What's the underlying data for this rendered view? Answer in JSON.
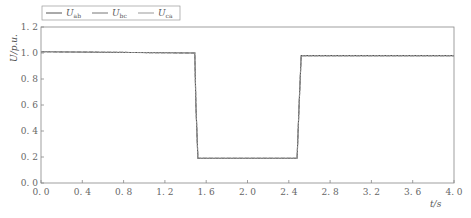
{
  "chart_data": {
    "type": "line",
    "title": "",
    "xlabel": "t/s",
    "ylabel": "U/p.u.",
    "xlim": [
      0.0,
      4.0
    ],
    "ylim": [
      0.0,
      1.2
    ],
    "xticks": [
      "0.0",
      "0.4",
      "0.8",
      "1.2",
      "1.6",
      "2.0",
      "2.4",
      "2.8",
      "3.2",
      "3.6",
      "4.0"
    ],
    "yticks": [
      "0.0",
      "0.2",
      "0.4",
      "0.6",
      "0.8",
      "1.0",
      "1.2"
    ],
    "grid": false,
    "legend_position": "top-left, above plot",
    "legend": [
      "U_ab",
      "U_bc",
      "U_ca"
    ],
    "series": [
      {
        "name": "U_ab",
        "color": "#555555",
        "points": [
          [
            0.0,
            1.01
          ],
          [
            1.49,
            1.0
          ],
          [
            1.5,
            0.6
          ],
          [
            1.52,
            0.19
          ],
          [
            2.48,
            0.19
          ],
          [
            2.5,
            0.6
          ],
          [
            2.52,
            0.98
          ],
          [
            4.0,
            0.98
          ]
        ]
      },
      {
        "name": "U_bc",
        "color": "#777777",
        "points": [
          [
            0.0,
            1.01
          ],
          [
            1.49,
            1.0
          ],
          [
            1.5,
            0.6
          ],
          [
            1.52,
            0.19
          ],
          [
            2.48,
            0.19
          ],
          [
            2.5,
            0.6
          ],
          [
            2.52,
            0.98
          ],
          [
            4.0,
            0.98
          ]
        ]
      },
      {
        "name": "U_ca",
        "color": "#999999",
        "points": [
          [
            0.0,
            1.01
          ],
          [
            1.49,
            1.0
          ],
          [
            1.5,
            0.6
          ],
          [
            1.52,
            0.19
          ],
          [
            2.48,
            0.19
          ],
          [
            2.5,
            0.6
          ],
          [
            2.52,
            0.98
          ],
          [
            4.0,
            0.98
          ]
        ]
      }
    ]
  },
  "legend": {
    "items": [
      {
        "symbol": "U",
        "sub": "ab"
      },
      {
        "symbol": "U",
        "sub": "bc"
      },
      {
        "symbol": "U",
        "sub": "ca"
      }
    ]
  },
  "axes": {
    "x_label_main": "t",
    "x_label_unit": "/s",
    "y_label_main": "U",
    "y_label_unit": "/p.u."
  }
}
